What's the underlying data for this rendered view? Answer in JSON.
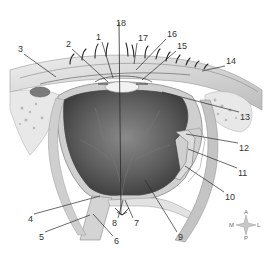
{
  "diagram": {
    "labels": [
      {
        "id": "1",
        "text": "1",
        "x": 96,
        "y": 32,
        "tx": 113,
        "ty": 78
      },
      {
        "id": "2",
        "text": "2",
        "x": 66,
        "y": 39,
        "tx": 108,
        "ty": 82
      },
      {
        "id": "3",
        "text": "3",
        "x": 18,
        "y": 44,
        "tx": 56,
        "ty": 77
      },
      {
        "id": "4",
        "text": "4",
        "x": 28,
        "y": 214,
        "tx": 100,
        "ty": 196
      },
      {
        "id": "5",
        "text": "5",
        "x": 39,
        "y": 232,
        "tx": 90,
        "ty": 215
      },
      {
        "id": "6",
        "text": "6",
        "x": 114,
        "y": 236,
        "tx": 93,
        "ty": 214
      },
      {
        "id": "7",
        "text": "7",
        "x": 134,
        "y": 218,
        "tx": 125,
        "ty": 200
      },
      {
        "id": "8",
        "text": "8",
        "x": 112,
        "y": 218,
        "tx": 123,
        "ty": 200
      },
      {
        "id": "9",
        "text": "9",
        "x": 178,
        "y": 232,
        "tx": 145,
        "ty": 180
      },
      {
        "id": "10",
        "text": "10",
        "x": 225,
        "y": 192,
        "tx": 185,
        "ty": 166
      },
      {
        "id": "11",
        "text": "11",
        "x": 238,
        "y": 168,
        "tx": 188,
        "ty": 149
      },
      {
        "id": "12",
        "text": "12",
        "x": 239,
        "y": 143,
        "tx": 186,
        "ty": 134
      },
      {
        "id": "13",
        "text": "13",
        "x": 240,
        "y": 112,
        "tx": 162,
        "ty": 92
      },
      {
        "id": "14",
        "text": "14",
        "x": 226,
        "y": 56,
        "tx": 202,
        "ty": 71
      },
      {
        "id": "15",
        "text": "15",
        "x": 177,
        "y": 41,
        "tx": 142,
        "ty": 80
      },
      {
        "id": "16",
        "text": "16",
        "x": 167,
        "y": 29,
        "tx": 136,
        "ty": 70
      },
      {
        "id": "17",
        "text": "17",
        "x": 138,
        "y": 33,
        "tx": 134,
        "ty": 64
      },
      {
        "id": "18",
        "text": "18",
        "x": 116,
        "y": 18,
        "tx": 122,
        "ty": 215
      }
    ],
    "compass": {
      "top": "A",
      "bottom": "P",
      "left": "M",
      "right": "L"
    }
  },
  "colors": {
    "line": "#2a2a2a",
    "vitreous": "#5a5a5a",
    "tissue": "#d8d8d8",
    "bone": "#e6e6e6"
  }
}
